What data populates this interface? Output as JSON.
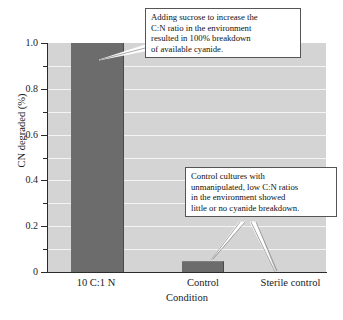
{
  "chart_data": {
    "type": "bar",
    "title": "",
    "xlabel": "Condition",
    "ylabel": "CN degraded (%)",
    "categories": [
      "10 C:1 N",
      "Control",
      "Sterile control"
    ],
    "values": [
      1.0,
      0.045,
      0.0
    ],
    "ylim": [
      0,
      1.0
    ],
    "ytick_labels": [
      "0",
      "0.2",
      "0.4",
      "0.6",
      "0.8",
      "1.0"
    ],
    "ytick_values": [
      0,
      0.2,
      0.4,
      0.6,
      0.8,
      1.0
    ],
    "minor_tick_interval": 0.1,
    "grid": true,
    "grid_orientation": "horizontal",
    "legend": false,
    "bar_color": "#6c6c6c",
    "plot_background": "#d4d4d4",
    "gridline_color": "#f4f4f4",
    "annotations": [
      {
        "id": "callout-sucrose",
        "lines": [
          "Adding sucrose to increase the",
          "C:N ratio in the environment",
          "resulted in 100% breakdown",
          "of available cyanide."
        ],
        "points_to": [
          "10 C:1 N"
        ]
      },
      {
        "id": "callout-control",
        "lines": [
          "Control cultures with",
          "unmanipulated, low C:N ratios",
          "in the environment showed",
          "little or no cyanide breakdown."
        ],
        "points_to": [
          "Control",
          "Sterile control"
        ]
      }
    ]
  },
  "axis": {
    "y": {
      "label": "CN degraded (%)",
      "ticks": [
        {
          "label": "1.0",
          "value": 1.0
        },
        {
          "label": "0.8",
          "value": 0.8
        },
        {
          "label": "0.6",
          "value": 0.6
        },
        {
          "label": "0.4",
          "value": 0.4
        },
        {
          "label": "0.2",
          "value": 0.2
        },
        {
          "label": "0",
          "value": 0
        }
      ]
    },
    "x": {
      "label": "Condition",
      "ticks": [
        {
          "label": "10 C:1 N"
        },
        {
          "label": "Control"
        },
        {
          "label": "Sterile control"
        }
      ]
    }
  },
  "callouts": {
    "sucrose": {
      "line1": "Adding sucrose to increase the",
      "line2": "C:N ratio in the environment",
      "line3": "resulted in 100% breakdown",
      "line4": "of available cyanide."
    },
    "control": {
      "line1": "Control cultures with",
      "line2": "unmanipulated, low C:N ratios",
      "line3": "in the environment showed",
      "line4": "little or no cyanide breakdown."
    }
  }
}
